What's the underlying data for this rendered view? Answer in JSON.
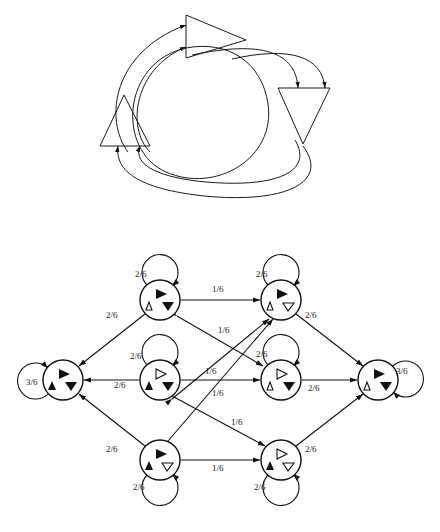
{
  "figure": {
    "title_top": "",
    "title_bottom": "",
    "top_diagram": {
      "name": "three-triangle-cycle",
      "shapes": [
        {
          "id": "tri-top",
          "icon": "triangle-right",
          "filled": false,
          "cx": 207,
          "cy": 36
        },
        {
          "id": "tri-left",
          "icon": "triangle-up",
          "filled": false,
          "cx": 124,
          "cy": 119
        },
        {
          "id": "tri-right",
          "icon": "triangle-down",
          "filled": false,
          "cx": 303,
          "cy": 110
        }
      ],
      "arc_count": 6
    },
    "graph": {
      "name": "state-transition-graph",
      "node_radius": 20,
      "nodes": [
        {
          "id": "n-top-left",
          "cx": 160,
          "cy": 300,
          "glyphs": [
            "triangle-right-filled",
            "triangle-up-hollow",
            "triangle-down-filled"
          ],
          "self_loop": {
            "label": "2/6",
            "side": "top"
          }
        },
        {
          "id": "n-top-right",
          "cx": 281,
          "cy": 300,
          "glyphs": [
            "triangle-right-filled",
            "triangle-up-hollow",
            "triangle-down-hollow"
          ],
          "self_loop": {
            "label": "2/6",
            "side": "top"
          }
        },
        {
          "id": "n-left",
          "cx": 63,
          "cy": 380,
          "glyphs": [
            "triangle-right-filled",
            "triangle-up-filled",
            "triangle-down-filled"
          ],
          "self_loop": {
            "label": "3/6",
            "side": "left"
          }
        },
        {
          "id": "n-center-left",
          "cx": 160,
          "cy": 380,
          "glyphs": [
            "triangle-right-hollow",
            "triangle-up-filled",
            "triangle-down-filled"
          ],
          "self_loop": {
            "label": "2/6",
            "side": "top"
          }
        },
        {
          "id": "n-center-right",
          "cx": 281,
          "cy": 380,
          "glyphs": [
            "triangle-right-hollow",
            "triangle-up-hollow",
            "triangle-down-filled"
          ],
          "self_loop": {
            "label": "2/6",
            "side": "top"
          }
        },
        {
          "id": "n-right",
          "cx": 378,
          "cy": 380,
          "glyphs": [
            "triangle-right-filled",
            "triangle-up-hollow",
            "triangle-down-filled"
          ],
          "self_loop": {
            "label": "3/6",
            "side": "right"
          }
        },
        {
          "id": "n-bottom-left",
          "cx": 160,
          "cy": 460,
          "glyphs": [
            "triangle-right-filled",
            "triangle-up-filled",
            "triangle-down-hollow"
          ],
          "self_loop": {
            "label": "2/6",
            "side": "bottom"
          }
        },
        {
          "id": "n-bottom-right",
          "cx": 281,
          "cy": 460,
          "glyphs": [
            "triangle-right-hollow",
            "triangle-up-filled",
            "triangle-down-hollow"
          ],
          "self_loop": {
            "label": "2/6",
            "side": "bottom"
          }
        }
      ],
      "edges": [
        {
          "from": "n-top-left",
          "to": "n-top-right",
          "label": "1/6",
          "lx": 221,
          "ly": 291
        },
        {
          "from": "n-center-left",
          "to": "n-center-right",
          "label": "1/6",
          "lx": 212,
          "ly": 372
        },
        {
          "from": "n-bottom-left",
          "to": "n-bottom-right",
          "label": "1/6",
          "lx": 221,
          "ly": 470
        },
        {
          "from": "n-top-left",
          "to": "n-left",
          "label": "2/6",
          "lx": 113,
          "ly": 317
        },
        {
          "from": "n-center-left",
          "to": "n-left",
          "label": "2/6",
          "lx": 122,
          "ly": 385
        },
        {
          "from": "n-bottom-left",
          "to": "n-left",
          "label": "2/6",
          "lx": 113,
          "ly": 452
        },
        {
          "from": "n-top-right",
          "to": "n-right",
          "label": "2/6",
          "lx": 311,
          "ly": 317
        },
        {
          "from": "n-center-right",
          "to": "n-right",
          "label": "2/6",
          "lx": 318,
          "ly": 388
        },
        {
          "from": "n-bottom-right",
          "to": "n-right",
          "label": "2/6",
          "lx": 311,
          "ly": 452
        },
        {
          "from": "n-top-left",
          "to": "n-center-right",
          "label": "1/6",
          "lx": 226,
          "ly": 332
        },
        {
          "from": "n-center-left",
          "to": "n-top-right",
          "label": "1/6",
          "lx": 224,
          "ly": 395
        },
        {
          "from": "n-bottom-left",
          "to": "n-top-right",
          "label": "1/6",
          "lx": 238,
          "ly": 424
        },
        {
          "from": "n-center-left",
          "to": "n-bottom-right",
          "label": "1/6",
          "lx": 238,
          "ly": 424
        }
      ],
      "edge_labels": [
        "1/6",
        "2/6",
        "3/6"
      ]
    }
  }
}
